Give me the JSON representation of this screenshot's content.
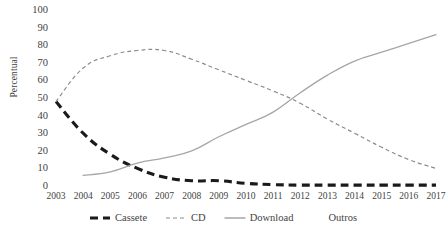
{
  "chart_data": {
    "type": "line",
    "title": "",
    "xlabel": "",
    "ylabel": "Percentual",
    "categories": [
      "2003",
      "2004",
      "2005",
      "2006",
      "2007",
      "2008",
      "2009",
      "2010",
      "2011",
      "2012",
      "2013",
      "2014",
      "2015",
      "2016",
      "2017"
    ],
    "x": [
      2003,
      2004,
      2005,
      2006,
      2007,
      2008,
      2009,
      2010,
      2011,
      2012,
      2013,
      2014,
      2015,
      2016,
      2017
    ],
    "ylim": [
      0,
      100
    ],
    "yticks": [
      "0",
      "10",
      "20",
      "30",
      "40",
      "50",
      "60",
      "70",
      "80",
      "90",
      "100"
    ],
    "ytick_values": [
      0,
      10,
      20,
      30,
      40,
      50,
      60,
      70,
      80,
      90,
      100
    ],
    "grid": false,
    "legend_position": "bottom",
    "series": [
      {
        "name": "Cassete",
        "style": "dashed-thick",
        "color": "#1a1a1a",
        "values": [
          48,
          30,
          18,
          10,
          5,
          3,
          3,
          1.5,
          0.8,
          0.5,
          0.5,
          0.5,
          0.5,
          0.5,
          0.5
        ]
      },
      {
        "name": "CD",
        "style": "dashed-thin",
        "color": "#8c8c8c",
        "values": [
          48,
          67,
          74,
          77,
          77,
          72,
          66,
          60,
          54,
          47,
          38,
          30,
          22,
          15,
          10
        ]
      },
      {
        "name": "Download",
        "style": "solid",
        "color": "#a6a6a6",
        "values": [
          null,
          6,
          8,
          13,
          16,
          20,
          28,
          35,
          42,
          53,
          63,
          71,
          76,
          81,
          86
        ]
      },
      {
        "name": "Outros",
        "style": "none",
        "color": "#ffffff",
        "values": [
          0,
          0,
          0,
          0,
          0,
          0,
          0,
          0,
          0,
          0,
          0,
          0,
          0,
          0,
          0
        ]
      }
    ]
  },
  "legend": {
    "items": [
      {
        "label": "Cassete"
      },
      {
        "label": "CD"
      },
      {
        "label": "Download"
      },
      {
        "label": "Outros"
      }
    ]
  }
}
